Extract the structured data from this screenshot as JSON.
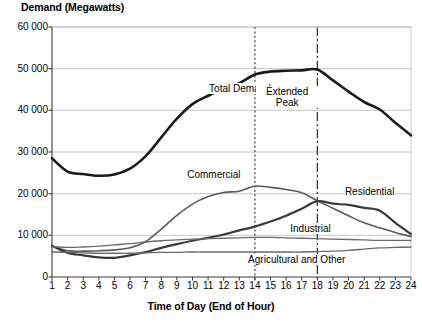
{
  "chart_data": {
    "type": "line",
    "title": "Demand (Megawatts)",
    "xlabel": "Time of Day (End of Hour)",
    "ylabel": "Demand (Megawatts)",
    "xlim": [
      1,
      24
    ],
    "ylim": [
      0,
      60000
    ],
    "grid": true,
    "legend_position": "inline-annotations",
    "x": [
      1,
      2,
      3,
      4,
      5,
      6,
      7,
      8,
      9,
      10,
      11,
      12,
      13,
      14,
      15,
      16,
      17,
      18,
      19,
      20,
      21,
      22,
      23,
      24
    ],
    "xtick_labels": [
      "1",
      "2",
      "3",
      "4",
      "5",
      "6",
      "7",
      "8",
      "9",
      "10",
      "11",
      "12",
      "13",
      "14",
      "15",
      "16",
      "17",
      "18",
      "19",
      "20",
      "21",
      "22",
      "23",
      "24"
    ],
    "ytick_labels": [
      "0",
      "10 000",
      "20 000",
      "30 000",
      "40 000",
      "50 000",
      "60 000"
    ],
    "ytick_values": [
      0,
      10000,
      20000,
      30000,
      40000,
      50000,
      60000
    ],
    "series": [
      {
        "name": "Total Demand",
        "color": "#1a1a1a",
        "width": 2.6,
        "label_x": 11.0,
        "label_y": 45200,
        "values": [
          28500,
          25300,
          24700,
          24300,
          24600,
          26000,
          29000,
          33500,
          38000,
          41500,
          43500,
          45200,
          46500,
          48600,
          49300,
          49500,
          49600,
          49800,
          47200,
          44500,
          42000,
          40200,
          37000,
          34000
        ]
      },
      {
        "name": "Commercial",
        "color": "#5a5a5a",
        "width": 1.6,
        "label_x": 9.6,
        "label_y": 24600,
        "values": [
          7400,
          6300,
          6200,
          6300,
          6500,
          7000,
          8500,
          11500,
          14800,
          17500,
          19300,
          20300,
          20600,
          21800,
          21500,
          21000,
          20200,
          18300,
          16500,
          14700,
          13000,
          11800,
          10700,
          9700
        ]
      },
      {
        "name": "Residential",
        "color": "#3a3a3a",
        "width": 2.2,
        "label_x": 19.7,
        "label_y": 20400,
        "values": [
          7500,
          5800,
          5200,
          4700,
          4600,
          5200,
          6000,
          7000,
          7900,
          8700,
          9400,
          10200,
          11200,
          12100,
          13300,
          14700,
          16400,
          18200,
          17600,
          17300,
          16600,
          15900,
          13000,
          10300
        ]
      },
      {
        "name": "Industrial",
        "color": "#6a6a6a",
        "width": 1.3,
        "label_x": 16.2,
        "label_y": 11600,
        "values": [
          7300,
          7100,
          7200,
          7400,
          7700,
          8000,
          8400,
          8700,
          8900,
          9100,
          9200,
          9300,
          9400,
          9500,
          9500,
          9400,
          9300,
          9200,
          9100,
          9000,
          8900,
          8800,
          8800,
          8800
        ]
      },
      {
        "name": "Agricultural and Other",
        "color": "#6a6a6a",
        "width": 1.3,
        "label_x": 13.5,
        "label_y": 4100,
        "values": [
          6000,
          5900,
          5800,
          5700,
          5700,
          5700,
          5800,
          5900,
          5900,
          6000,
          6000,
          6000,
          6000,
          6000,
          6000,
          6000,
          6000,
          6100,
          6200,
          6400,
          6700,
          7000,
          7100,
          7200
        ]
      }
    ],
    "annotations": [
      {
        "text": "Extended\nPeak",
        "line1": "Extended",
        "line2": "Peak",
        "x": 16.0,
        "y": 44500
      }
    ],
    "vertical_markers": [
      {
        "x": 14,
        "style": "dashed",
        "color": "#3a3a3a"
      },
      {
        "x": 18,
        "style": "dash-dot",
        "color": "#2a2a2a"
      }
    ]
  }
}
